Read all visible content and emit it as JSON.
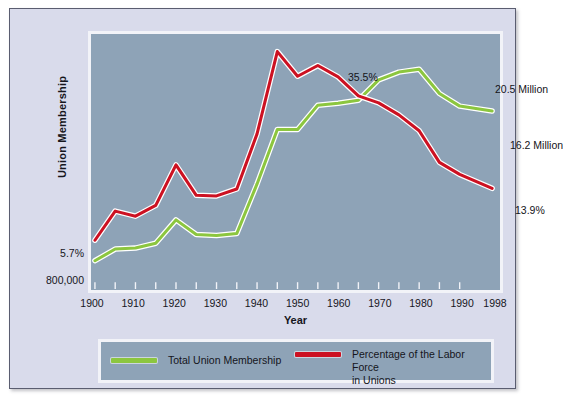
{
  "figure": {
    "background_color": "#d9dbeb",
    "plot_background_color": "#8ea3b7",
    "frame_color": "#f2f3f8"
  },
  "axes": {
    "y_title": "Union Membership",
    "x_title": "Year",
    "y_edge_labels": {
      "percent_start": "5.7%",
      "membership_start": "800,000"
    },
    "x_tick_labels": [
      "1900",
      "1910",
      "1920",
      "1930",
      "1940",
      "1950",
      "1960",
      "1970",
      "1980",
      "1990",
      "1998"
    ]
  },
  "annotations": [
    {
      "id": "peak-percent",
      "text": "35.5%"
    },
    {
      "id": "peak-membership",
      "text": "20.5 Million"
    },
    {
      "id": "end-membership",
      "text": "16.2 Million"
    },
    {
      "id": "end-percent",
      "text": "13.9%"
    }
  ],
  "legend": {
    "entries": [
      {
        "label": "Total Union Membership",
        "color": "#8cc63f"
      },
      {
        "label": "Percentage of the Labor Force in  Unions",
        "color": "#cc1122"
      }
    ]
  },
  "chart_data": {
    "type": "line",
    "title": "",
    "xlabel": "Year",
    "ylabel": "Union Membership",
    "xlim": [
      1900,
      1998
    ],
    "ylim": [
      0,
      40
    ],
    "grid": false,
    "legend_position": "bottom",
    "x": [
      1900,
      1905,
      1910,
      1915,
      1920,
      1925,
      1930,
      1935,
      1940,
      1945,
      1950,
      1955,
      1960,
      1965,
      1970,
      1975,
      1980,
      1985,
      1990,
      1998
    ],
    "series": [
      {
        "name": "Total Union Membership",
        "color": "#8cc63f",
        "units": "millions of members",
        "values": [
          0.8,
          2.0,
          2.1,
          2.6,
          5.0,
          3.5,
          3.4,
          3.6,
          8.7,
          14.3,
          14.3,
          16.8,
          17.0,
          17.3,
          19.4,
          20.2,
          20.5,
          18.0,
          16.7,
          16.2
        ],
        "endpoint_labels": {
          "1900": "800,000",
          "1980": "20.5 Million",
          "1998": "16.2 Million"
        }
      },
      {
        "name": "Percentage of the Labor Force in Unions",
        "color": "#cc1122",
        "units": "percent of labor force",
        "values": [
          5.7,
          10.3,
          9.5,
          11.2,
          17.6,
          12.8,
          12.7,
          13.8,
          22.5,
          35.5,
          31.6,
          33.3,
          31.5,
          28.5,
          27.4,
          25.5,
          23.0,
          18.0,
          16.1,
          13.9
        ],
        "endpoint_labels": {
          "1900": "5.7%",
          "1945": "35.5%",
          "1998": "13.9%"
        }
      }
    ]
  }
}
